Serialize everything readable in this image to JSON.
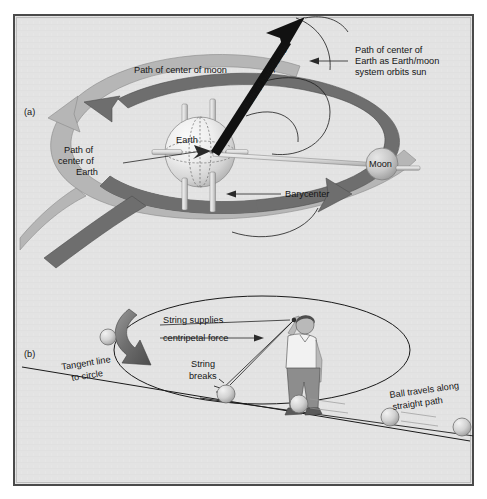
{
  "figure": {
    "background_color": "#ffffff",
    "panel_background_color": "#e3e3e3",
    "panel_border_color": "#4a4a4a",
    "ink_color": "#151515",
    "band_light_color": "#b6b6b6",
    "band_dark_color": "#6e6e6e",
    "arrow_black_color": "#111111",
    "sphere_light_color": "#f0f0f0",
    "sphere_mid_color": "#c9c9c9",
    "skin_color": "#b9b9b9",
    "shirt_color": "#f2f2f2",
    "pants_color": "#8d8d8d"
  },
  "panel_a": {
    "panel_label": "(a)",
    "labels": {
      "path_of_center_of_moon": "Path of center of moon",
      "path_of_barycenter": "Path of barycenter",
      "path_of_center_of_earth_as_system_orbits_sun": "Path of center of\nEarth as Earth/moon\nsystem orbits sun",
      "path_of_center_of_earth": "Path of\ncenter of\nEarth",
      "barycenter": "Barycenter",
      "earth": "Earth",
      "moon": "Moon"
    },
    "label_lines": {
      "sun_path_line1": "Path of center of",
      "sun_path_line2": "Earth as Earth/moon",
      "sun_path_line3": "system orbits sun",
      "earth_path_line1": "Path of",
      "earth_path_line2": "center of",
      "earth_path_line3": "Earth"
    }
  },
  "panel_b": {
    "panel_label": "(b)",
    "labels": {
      "string_supplies": "String supplies",
      "centripetal_force": "centripetal force",
      "tangent_line_line1": "Tangent line",
      "tangent_line_line2": "to circle",
      "string_breaks_line1": "String",
      "string_breaks_line2": "breaks",
      "ball_travels_line1": "Ball travels along",
      "ball_travels_line2": "straight path"
    }
  }
}
